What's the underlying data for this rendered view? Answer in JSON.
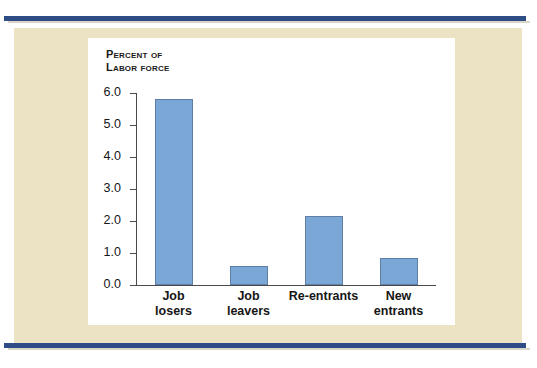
{
  "page": {
    "background_color": "#ece3c4",
    "rule_color": "#2e4d86",
    "panel_color": "#ffffff"
  },
  "chart_data": {
    "type": "bar",
    "title": "",
    "subtitle": "",
    "ylabel_line1": "Percent of",
    "ylabel_line2": "Labor force",
    "xlabel": "",
    "categories": [
      "Job losers",
      "Job leavers",
      "Re-entrants",
      "New entrants"
    ],
    "category_lines": [
      [
        "Job",
        "losers"
      ],
      [
        "Job",
        "leavers"
      ],
      [
        "Re-entrants",
        ""
      ],
      [
        "New",
        "entrants"
      ]
    ],
    "values": [
      5.8,
      0.6,
      2.15,
      0.85
    ],
    "ylim": [
      0.0,
      6.0
    ],
    "ytick_labels": [
      "6.0",
      "5.0",
      "4.0",
      "3.0",
      "2.0",
      "1.0",
      "0.0"
    ],
    "ytick_values": [
      6.0,
      5.0,
      4.0,
      3.0,
      2.0,
      1.0,
      0.0
    ],
    "grid": false,
    "legend": false,
    "legend_position": "none",
    "bar_color": "#7ba7d7",
    "bar_border_color": "#5f7fa6",
    "axis_color": "#4a4a4a"
  }
}
